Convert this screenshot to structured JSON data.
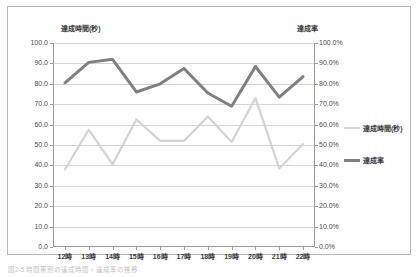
{
  "frame": {
    "border_color": "#b9b9b9",
    "background": "#ffffff"
  },
  "caption": {
    "text": "図2-5  時間帯別の達成時間・達成率の推移"
  },
  "legend": {
    "position": "right",
    "items": [
      {
        "label": "達成時間(秒)",
        "color": "#d3d3d3",
        "width": 2.2
      },
      {
        "label": "達成率",
        "color": "#808080",
        "width": 3.0
      }
    ]
  },
  "chart_data": {
    "type": "line",
    "title": "",
    "subtitle": "",
    "xlabel": "",
    "ylabel": "達成時間(秒)",
    "y2label": "達成率",
    "grid": true,
    "legend_position": "right",
    "categories": [
      "12時",
      "13時",
      "14時",
      "15時",
      "16時",
      "17時",
      "18時",
      "19時",
      "20時",
      "21時",
      "22時"
    ],
    "ylim": [
      0.0,
      100.0
    ],
    "ytick_labels": [
      "100.0",
      "90.0",
      "80.0",
      "70.0",
      "60.0",
      "50.0",
      "40.0",
      "30.0",
      "20.0",
      "10.0",
      "0.0"
    ],
    "ytick_values": [
      100.0,
      90.0,
      80.0,
      70.0,
      60.0,
      50.0,
      40.0,
      30.0,
      20.0,
      10.0,
      0.0
    ],
    "y2lim": [
      0.0,
      100.0
    ],
    "y2tick_labels": [
      "100.0%",
      "90.0%",
      "80.0%",
      "70.0%",
      "60.0%",
      "50.0%",
      "40.0%",
      "30.0%",
      "20.0%",
      "10.0%",
      "0.0%"
    ],
    "y2tick_values": [
      100.0,
      90.0,
      80.0,
      70.0,
      60.0,
      50.0,
      40.0,
      30.0,
      20.0,
      10.0,
      0.0
    ],
    "series": [
      {
        "name": "達成時間(秒)",
        "axis": "left",
        "color": "#d3d3d3",
        "stroke_width": 2.2,
        "values": [
          38.0,
          57.5,
          40.5,
          62.5,
          52.0,
          52.0,
          64.0,
          51.5,
          73.0,
          38.5,
          50.5
        ]
      },
      {
        "name": "達成率",
        "axis": "right",
        "color": "#808080",
        "stroke_width": 3.0,
        "values": [
          80.5,
          90.5,
          92.0,
          76.0,
          80.0,
          87.5,
          75.5,
          69.0,
          88.5,
          73.5,
          83.5
        ]
      }
    ]
  }
}
